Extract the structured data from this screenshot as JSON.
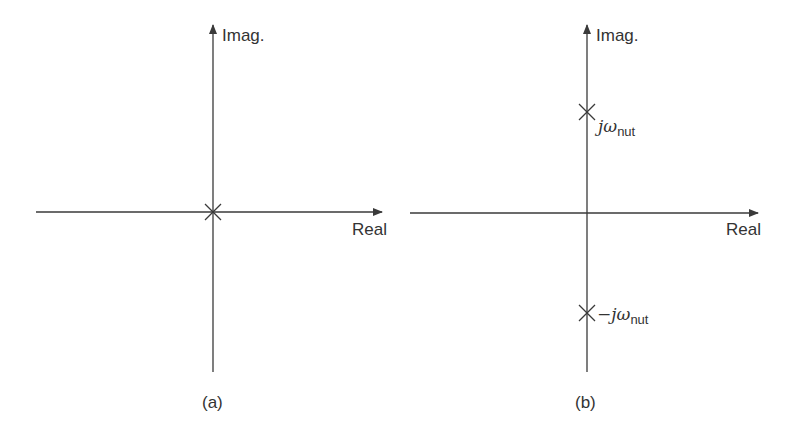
{
  "panels": [
    {
      "id": "a",
      "caption": "(a)",
      "imag_axis_label": "Imag.",
      "real_axis_label": "Real",
      "poles": [
        {
          "re": 0,
          "im": 0,
          "label": ""
        }
      ]
    },
    {
      "id": "b",
      "caption": "(b)",
      "imag_axis_label": "Imag.",
      "real_axis_label": "Real",
      "poles": [
        {
          "re": 0,
          "im": 1,
          "label_prefix": "jω",
          "label_sub": "nut"
        },
        {
          "re": 0,
          "im": -1,
          "label_prefix": "−jω",
          "label_sub": "nut"
        }
      ]
    }
  ],
  "colors": {
    "axis": "#3a3a3a",
    "text": "#333333",
    "background": "#ffffff"
  }
}
